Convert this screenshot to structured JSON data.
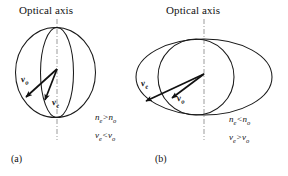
{
  "figure": {
    "background_color": "#ffffff",
    "stroke_color": "#1a1a1a",
    "axis_line_color": "#8c8c8c"
  },
  "panels": [
    {
      "tag": "(a)",
      "axis_title": "Optical axis",
      "type": "negative-uniaxial-positive-crystal",
      "outer_shape": "circle",
      "inner_shape": "narrow-ellipse",
      "vectors": [
        {
          "name": "v_o",
          "label_main": "v",
          "label_sub": "o",
          "length": "long"
        },
        {
          "name": "v_e",
          "label_main": "v",
          "label_sub": "e",
          "length": "short"
        }
      ],
      "relations": [
        {
          "left_main": "n",
          "left_sub": "e",
          "op": ">",
          "right_main": "n",
          "right_sub": "o"
        },
        {
          "left_main": "v",
          "left_sub": "e",
          "op": "<",
          "right_main": "v",
          "right_sub": "o"
        }
      ]
    },
    {
      "tag": "(b)",
      "axis_title": "Optical axis",
      "type": "positive-uniaxial-negative-crystal",
      "outer_shape": "wide-ellipse",
      "inner_shape": "circle",
      "vectors": [
        {
          "name": "v_e",
          "label_main": "v",
          "label_sub": "e",
          "length": "long"
        },
        {
          "name": "v_o",
          "label_main": "v",
          "label_sub": "o",
          "length": "short"
        }
      ],
      "relations": [
        {
          "left_main": "n",
          "left_sub": "e",
          "op": "<",
          "right_main": "n",
          "right_sub": "o"
        },
        {
          "left_main": "v",
          "left_sub": "e",
          "op": ">",
          "right_main": "v",
          "right_sub": "o"
        }
      ]
    }
  ]
}
